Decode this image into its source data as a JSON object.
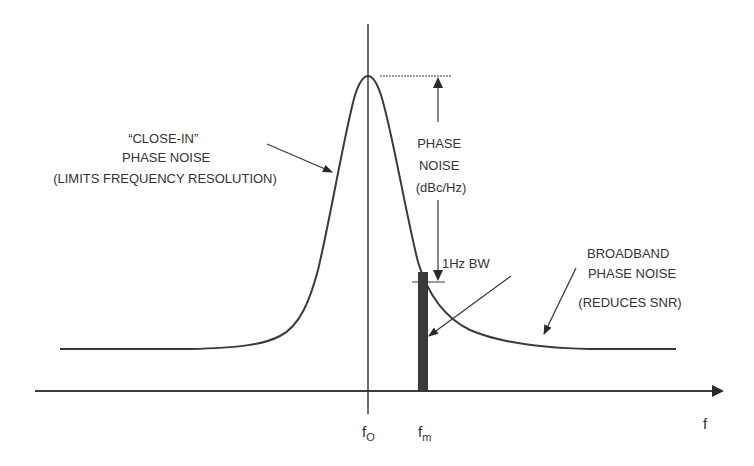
{
  "diagram": {
    "colors": {
      "line": "#3a3a3a",
      "fill": "#3a3a3a",
      "background": "#ffffff",
      "text": "#333333"
    },
    "labels": {
      "close_in": [
        "“CLOSE-IN”",
        "PHASE NOISE",
        "(LIMITS FREQUENCY RESOLUTION)"
      ],
      "phase_noise": [
        "PHASE",
        "NOISE",
        "(dBc/Hz)"
      ],
      "bandwidth": "1Hz BW",
      "broadband": [
        "BROADBAND",
        "PHASE NOISE"
      ],
      "broadband_note": "(REDUCES SNR)"
    },
    "axis": {
      "x_label": "f",
      "carrier_label": "f",
      "carrier_sub": "O",
      "offset_label": "f",
      "offset_sub": "m"
    }
  }
}
